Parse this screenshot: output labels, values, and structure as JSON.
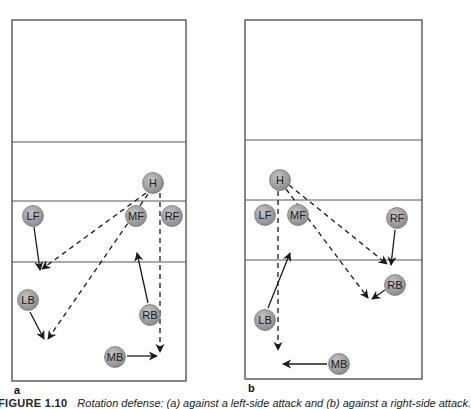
{
  "figure": {
    "caption_number": "FIGURE 1.10",
    "caption_text": "Rotation defense: (a) against a left-side attack and (b) against a right-side attack.",
    "colors": {
      "court_line": "#555555",
      "player_fill": "#9a9a9a",
      "player_stroke": "#7a7a7a",
      "player_text": "#1a1a1a",
      "arrow": "#1a1a1a"
    }
  },
  "panels": [
    {
      "label": "a",
      "court": {
        "x1": 12,
        "y1": 20,
        "x2": 186,
        "y2": 381,
        "lines_y": [
          142,
          201,
          262
        ]
      },
      "players": [
        {
          "id": "H",
          "label": "H",
          "x": 153,
          "y": 183
        },
        {
          "id": "LF",
          "label": "LF",
          "x": 33,
          "y": 216
        },
        {
          "id": "MF",
          "label": "MF",
          "x": 136,
          "y": 216
        },
        {
          "id": "RF",
          "label": "RF",
          "x": 172,
          "y": 216
        },
        {
          "id": "LB",
          "label": "LB",
          "x": 28,
          "y": 300
        },
        {
          "id": "RB",
          "label": "RB",
          "x": 150,
          "y": 315
        },
        {
          "id": "MB",
          "label": "MB",
          "x": 115,
          "y": 357
        }
      ],
      "movements": [
        {
          "from": "LF",
          "x1": 34,
          "y1": 227,
          "x2": 40,
          "y2": 270,
          "style": "solid"
        },
        {
          "from": "LB",
          "x1": 30,
          "y1": 312,
          "x2": 44,
          "y2": 339,
          "style": "solid"
        },
        {
          "from": "RB",
          "x1": 148,
          "y1": 303,
          "x2": 137,
          "y2": 253,
          "style": "solid"
        },
        {
          "from": "MB",
          "x1": 127,
          "y1": 356,
          "x2": 157,
          "y2": 356,
          "style": "solid"
        },
        {
          "from": "H",
          "x1": 146,
          "y1": 193,
          "x2": 42,
          "y2": 269,
          "style": "dashed"
        },
        {
          "from": "H",
          "x1": 148,
          "y1": 194,
          "x2": 48,
          "y2": 339,
          "style": "dashed"
        },
        {
          "from": "H",
          "x1": 160,
          "y1": 193,
          "x2": 160,
          "y2": 352,
          "style": "dashed"
        }
      ]
    },
    {
      "label": "b",
      "court": {
        "x1": 245,
        "y1": 20,
        "x2": 422,
        "y2": 379,
        "lines_y": [
          140,
          200,
          260
        ]
      },
      "players": [
        {
          "id": "H",
          "label": "H",
          "x": 280,
          "y": 180
        },
        {
          "id": "LF",
          "label": "LF",
          "x": 265,
          "y": 215
        },
        {
          "id": "MF",
          "label": "MF",
          "x": 298,
          "y": 215
        },
        {
          "id": "RF",
          "label": "RF",
          "x": 397,
          "y": 218
        },
        {
          "id": "RB",
          "label": "RB",
          "x": 395,
          "y": 285
        },
        {
          "id": "LB",
          "label": "LB",
          "x": 265,
          "y": 320
        },
        {
          "id": "MB",
          "label": "MB",
          "x": 339,
          "y": 364
        }
      ],
      "movements": [
        {
          "from": "RF",
          "x1": 395,
          "y1": 230,
          "x2": 391,
          "y2": 265,
          "style": "solid"
        },
        {
          "from": "RB",
          "x1": 385,
          "y1": 290,
          "x2": 372,
          "y2": 299,
          "style": "solid"
        },
        {
          "from": "LB",
          "x1": 268,
          "y1": 308,
          "x2": 290,
          "y2": 253,
          "style": "solid"
        },
        {
          "from": "MB",
          "x1": 327,
          "y1": 364,
          "x2": 283,
          "y2": 364,
          "style": "solid"
        },
        {
          "from": "H",
          "x1": 278,
          "y1": 191,
          "x2": 278,
          "y2": 350,
          "style": "dashed"
        },
        {
          "from": "H",
          "x1": 289,
          "y1": 185,
          "x2": 387,
          "y2": 264,
          "style": "dashed"
        },
        {
          "from": "H",
          "x1": 286,
          "y1": 189,
          "x2": 368,
          "y2": 298,
          "style": "dashed"
        }
      ]
    }
  ]
}
